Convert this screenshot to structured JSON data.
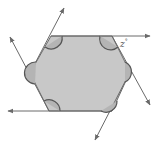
{
  "diagram": {
    "shape": "hexagon",
    "fill_color": "#c8c8c8",
    "stroke_color": "#6a6a6a",
    "arc_color": "#555555",
    "angle_label": "z°",
    "angle_label_text": "z",
    "angle_label_unit": "°",
    "vertices": [
      [
        51,
        36
      ],
      [
        112,
        36
      ],
      [
        130,
        72
      ],
      [
        112,
        111
      ],
      [
        49,
        111
      ],
      [
        30,
        73
      ]
    ],
    "rays": [
      {
        "from": [
          51,
          36
        ],
        "to": [
          150,
          36
        ],
        "name": "top-edge-ray"
      },
      {
        "from": [
          49,
          111
        ],
        "to": [
          64,
          8
        ],
        "name": "upper-left-ray"
      },
      {
        "from": [
          49,
          111
        ],
        "to": [
          10,
          37
        ],
        "name": "left-ray"
      },
      {
        "from": [
          112,
          111
        ],
        "to": [
          8,
          111
        ],
        "name": "bottom-edge-ray"
      },
      {
        "from": [
          130,
          72
        ],
        "to": [
          95,
          140
        ],
        "name": "lower-right-ray"
      },
      {
        "from": [
          112,
          36
        ],
        "to": [
          150,
          105
        ],
        "name": "right-ray"
      }
    ]
  }
}
